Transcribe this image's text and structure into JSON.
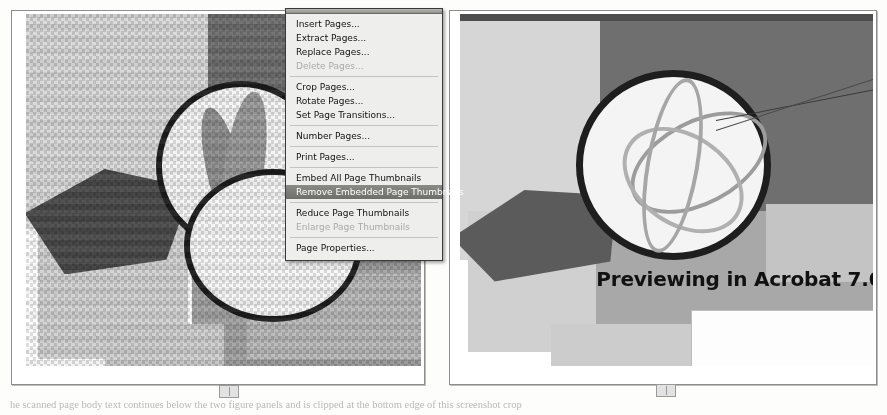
{
  "figures": {
    "left_panel": {
      "name": "pixelated-thumbnail-preview",
      "alt": "Coarse pixelated dithered preview of an abstract graphic"
    },
    "right_panel": {
      "name": "smooth-acrobat-preview",
      "caption": "Previewing in Acrobat 7.0",
      "alt": "Smooth high resolution rendering of the same abstract graphic"
    }
  },
  "pages_menu": {
    "title": "Pages",
    "items": [
      {
        "label": "Insert Pages...",
        "state": "normal",
        "separator_after": false
      },
      {
        "label": "Extract Pages...",
        "state": "normal",
        "separator_after": false
      },
      {
        "label": "Replace Pages...",
        "state": "normal",
        "separator_after": false
      },
      {
        "label": "Delete Pages...",
        "state": "disabled",
        "separator_after": true
      },
      {
        "label": "Crop Pages...",
        "state": "normal",
        "separator_after": false
      },
      {
        "label": "Rotate Pages...",
        "state": "normal",
        "separator_after": false
      },
      {
        "label": "Set Page Transitions...",
        "state": "normal",
        "separator_after": true
      },
      {
        "label": "Number Pages...",
        "state": "normal",
        "separator_after": true
      },
      {
        "label": "Print Pages...",
        "state": "normal",
        "separator_after": true
      },
      {
        "label": "Embed All Page Thumbnails",
        "state": "normal",
        "separator_after": false
      },
      {
        "label": "Remove Embedded Page Thumbnails",
        "state": "selected",
        "separator_after": true
      },
      {
        "label": "Reduce Page Thumbnails",
        "state": "normal",
        "separator_after": false
      },
      {
        "label": "Enlarge Page Thumbnails",
        "state": "disabled",
        "separator_after": true
      },
      {
        "label": "Page Properties...",
        "state": "normal",
        "separator_after": false
      }
    ]
  },
  "body_text": "he scanned page body text continues below the two figure panels and is clipped at the bottom edge of this screenshot crop",
  "colors": {
    "menu_background": "#eeeeec",
    "menu_border": "#3a3a3a",
    "menu_selected": "#7b7b78",
    "menu_disabled_text": "#a9a9a6",
    "panel_border": "#8d8d8d",
    "page_background": "#fdfdfc",
    "caption_text": "#111111",
    "artwork_dark": "#6e6e6e",
    "artwork_light": "#d9d9d9",
    "artwork_outline": "#1c1c1c"
  }
}
